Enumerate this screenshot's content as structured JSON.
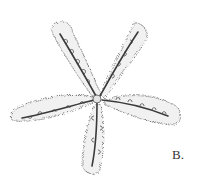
{
  "figure": {
    "label": "B.",
    "colors": {
      "background": "#ffffff",
      "outline": "#6a6a6a",
      "fill": "#efefef",
      "ink": "#3a3a3a"
    }
  }
}
